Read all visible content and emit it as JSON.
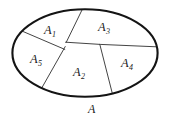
{
  "figure": {
    "kind": "set-partition-ellipse-diagram",
    "outline_color": "#141414",
    "divider_color": "#3a3a3a",
    "background_color": "#ffffff",
    "text_color": "#1b1b1b",
    "outline_stroke_width": 2.1,
    "divider_stroke_width": 0.9
  },
  "universal_set": {
    "name": "A",
    "label": "A",
    "label_position": "below-ellipse"
  },
  "regions": [
    {
      "id": "A1",
      "base": "A",
      "subscript": "1",
      "label": "A",
      "cx": 50,
      "cy": 30
    },
    {
      "id": "A2",
      "base": "A",
      "subscript": "2",
      "label": "A",
      "cx": 79,
      "cy": 72
    },
    {
      "id": "A3",
      "base": "A",
      "subscript": "3",
      "label": "A",
      "cx": 104,
      "cy": 27
    },
    {
      "id": "A4",
      "base": "A",
      "subscript": "4",
      "label": "A",
      "cx": 127,
      "cy": 63
    },
    {
      "id": "A5",
      "base": "A",
      "subscript": "5",
      "label": "A",
      "cx": 36,
      "cy": 59
    }
  ],
  "labels": {
    "A1": {
      "text": "A",
      "sub": "1"
    },
    "A2": {
      "text": "A",
      "sub": "2"
    },
    "A3": {
      "text": "A",
      "sub": "3"
    },
    "A4": {
      "text": "A",
      "sub": "4"
    },
    "A5": {
      "text": "A",
      "sub": "5"
    },
    "A": {
      "text": "A"
    }
  },
  "geometry": {
    "ellipse": {
      "cx": 85,
      "cy": 53,
      "rx": 73.5,
      "ry": 44.5
    },
    "vertex_center": {
      "x": 66,
      "y": 42
    },
    "dividers": [
      {
        "name": "A1-A3-boundary",
        "from": [
          83,
          8.8
        ],
        "to": [
          66,
          42
        ]
      },
      {
        "name": "A1-A5-boundary",
        "from": [
          22,
          31
        ],
        "to": [
          64.5,
          49
        ]
      },
      {
        "name": "A5-A2-boundary",
        "from": [
          64.5,
          47
        ],
        "to": [
          40,
          91
        ]
      },
      {
        "name": "A3A4-A2-boundary",
        "from": [
          66,
          42
        ],
        "to": [
          155,
          46
        ]
      },
      {
        "name": "A2-A4-boundary",
        "from": [
          100,
          44.5
        ],
        "to": [
          112,
          93
        ]
      }
    ]
  }
}
